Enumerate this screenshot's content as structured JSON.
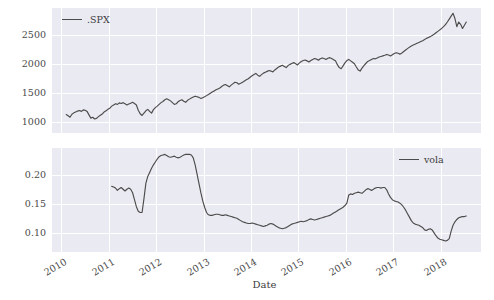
{
  "chart_data": [
    {
      "type": "line",
      "panel": "top",
      "title": "",
      "xlabel": "",
      "ylabel": "",
      "legend": ".SPX",
      "legend_position": "upper left",
      "grid": true,
      "xlim": [
        2009.8,
        2018.85
      ],
      "ylim": [
        820,
        2960
      ],
      "yticks": [
        1000,
        1500,
        2000,
        2500
      ],
      "ytick_labels": [
        "1000",
        "1500",
        "2000",
        "2500"
      ],
      "xticks": [
        2010,
        2011,
        2012,
        2013,
        2014,
        2015,
        2016,
        2017,
        2018
      ],
      "xtick_labels": [
        "2010",
        "2011",
        "2012",
        "2013",
        "2014",
        "2015",
        "2016",
        "2017",
        "2018"
      ],
      "series": [
        {
          "name": ".SPX",
          "color": "#4c4c4c",
          "x": [
            2010.1,
            2010.14,
            2010.18,
            2010.22,
            2010.26,
            2010.3,
            2010.34,
            2010.38,
            2010.42,
            2010.46,
            2010.5,
            2010.54,
            2010.58,
            2010.62,
            2010.66,
            2010.7,
            2010.74,
            2010.78,
            2010.82,
            2010.86,
            2010.9,
            2010.94,
            2010.98,
            2011.02,
            2011.06,
            2011.1,
            2011.14,
            2011.18,
            2011.22,
            2011.26,
            2011.3,
            2011.34,
            2011.38,
            2011.42,
            2011.46,
            2011.5,
            2011.54,
            2011.58,
            2011.62,
            2011.66,
            2011.7,
            2011.74,
            2011.78,
            2011.82,
            2011.86,
            2011.9,
            2011.94,
            2011.98,
            2012.02,
            2012.06,
            2012.1,
            2012.14,
            2012.18,
            2012.22,
            2012.26,
            2012.3,
            2012.34,
            2012.38,
            2012.42,
            2012.46,
            2012.5,
            2012.54,
            2012.58,
            2012.62,
            2012.66,
            2012.7,
            2012.74,
            2012.78,
            2012.82,
            2012.86,
            2012.9,
            2012.94,
            2012.98,
            2013.02,
            2013.06,
            2013.1,
            2013.14,
            2013.18,
            2013.22,
            2013.26,
            2013.3,
            2013.34,
            2013.38,
            2013.42,
            2013.46,
            2013.5,
            2013.54,
            2013.58,
            2013.62,
            2013.66,
            2013.7,
            2013.74,
            2013.78,
            2013.82,
            2013.86,
            2013.9,
            2013.94,
            2013.98,
            2014.02,
            2014.06,
            2014.1,
            2014.14,
            2014.18,
            2014.22,
            2014.26,
            2014.3,
            2014.34,
            2014.38,
            2014.42,
            2014.46,
            2014.5,
            2014.54,
            2014.58,
            2014.62,
            2014.66,
            2014.7,
            2014.74,
            2014.78,
            2014.82,
            2014.86,
            2014.9,
            2014.94,
            2014.98,
            2015.02,
            2015.06,
            2015.1,
            2015.14,
            2015.18,
            2015.22,
            2015.26,
            2015.3,
            2015.34,
            2015.38,
            2015.42,
            2015.46,
            2015.5,
            2015.54,
            2015.58,
            2015.62,
            2015.66,
            2015.7,
            2015.74,
            2015.78,
            2015.82,
            2015.86,
            2015.9,
            2015.94,
            2015.98,
            2016.02,
            2016.06,
            2016.1,
            2016.14,
            2016.18,
            2016.22,
            2016.26,
            2016.3,
            2016.34,
            2016.38,
            2016.42,
            2016.46,
            2016.5,
            2016.54,
            2016.58,
            2016.62,
            2016.66,
            2016.7,
            2016.74,
            2016.78,
            2016.82,
            2016.86,
            2016.9,
            2016.94,
            2016.98,
            2017.02,
            2017.06,
            2017.1,
            2017.14,
            2017.18,
            2017.22,
            2017.26,
            2017.3,
            2017.34,
            2017.38,
            2017.42,
            2017.46,
            2017.5,
            2017.54,
            2017.58,
            2017.62,
            2017.66,
            2017.7,
            2017.74,
            2017.78,
            2017.82,
            2017.86,
            2017.9,
            2017.94,
            2017.98,
            2018.02,
            2018.06,
            2018.1,
            2018.14,
            2018.18,
            2018.22,
            2018.26,
            2018.3,
            2018.34,
            2018.38,
            2018.42,
            2018.46,
            2018.5,
            2018.54
          ],
          "y": [
            1136,
            1115,
            1090,
            1140,
            1165,
            1180,
            1195,
            1205,
            1190,
            1215,
            1210,
            1190,
            1130,
            1075,
            1090,
            1060,
            1070,
            1100,
            1125,
            1145,
            1180,
            1200,
            1225,
            1245,
            1280,
            1300,
            1320,
            1310,
            1335,
            1325,
            1340,
            1320,
            1300,
            1315,
            1330,
            1345,
            1325,
            1300,
            1210,
            1150,
            1120,
            1160,
            1200,
            1225,
            1190,
            1160,
            1220,
            1255,
            1280,
            1310,
            1340,
            1360,
            1390,
            1405,
            1390,
            1370,
            1340,
            1310,
            1320,
            1355,
            1375,
            1390,
            1365,
            1345,
            1380,
            1400,
            1420,
            1435,
            1450,
            1440,
            1430,
            1410,
            1425,
            1440,
            1460,
            1480,
            1500,
            1520,
            1540,
            1560,
            1575,
            1590,
            1615,
            1640,
            1650,
            1630,
            1610,
            1640,
            1665,
            1690,
            1680,
            1655,
            1670,
            1690,
            1710,
            1730,
            1750,
            1775,
            1800,
            1820,
            1840,
            1810,
            1790,
            1820,
            1845,
            1860,
            1875,
            1890,
            1880,
            1865,
            1900,
            1925,
            1950,
            1965,
            1980,
            1960,
            1940,
            1975,
            1995,
            2010,
            2025,
            2005,
            1985,
            2020,
            2045,
            2060,
            2070,
            2055,
            2035,
            2060,
            2080,
            2095,
            2085,
            2065,
            2090,
            2105,
            2095,
            2080,
            2100,
            2110,
            2095,
            2075,
            2055,
            1990,
            1940,
            1920,
            1970,
            2020,
            2060,
            2080,
            2055,
            2030,
            2005,
            1950,
            1900,
            1880,
            1930,
            1975,
            2010,
            2045,
            2060,
            2080,
            2095,
            2090,
            2105,
            2120,
            2130,
            2140,
            2150,
            2165,
            2155,
            2140,
            2160,
            2180,
            2195,
            2185,
            2170,
            2190,
            2215,
            2240,
            2265,
            2290,
            2310,
            2325,
            2340,
            2355,
            2370,
            2385,
            2400,
            2420,
            2440,
            2455,
            2470,
            2490,
            2510,
            2535,
            2560,
            2585,
            2610,
            2640,
            2675,
            2720,
            2770,
            2820,
            2870,
            2780,
            2640,
            2720,
            2680,
            2610,
            2665,
            2720
          ]
        }
      ]
    },
    {
      "type": "line",
      "panel": "bottom",
      "title": "",
      "xlabel": "Date",
      "ylabel": "",
      "legend": "vola",
      "legend_position": "upper right",
      "grid": true,
      "xlim": [
        2009.8,
        2018.85
      ],
      "ylim": [
        0.068,
        0.247
      ],
      "yticks": [
        0.1,
        0.15,
        0.2
      ],
      "ytick_labels": [
        "0.10",
        "0.15",
        "0.20"
      ],
      "xticks": [
        2010,
        2011,
        2012,
        2013,
        2014,
        2015,
        2016,
        2017,
        2018
      ],
      "xtick_labels": [
        "2010",
        "2011",
        "2012",
        "2013",
        "2014",
        "2015",
        "2016",
        "2017",
        "2018"
      ],
      "series": [
        {
          "name": "vola",
          "color": "#6b6b6b",
          "x": [
            2011.06,
            2011.1,
            2011.14,
            2011.18,
            2011.22,
            2011.26,
            2011.3,
            2011.34,
            2011.38,
            2011.42,
            2011.46,
            2011.5,
            2011.54,
            2011.58,
            2011.62,
            2011.66,
            2011.7,
            2011.74,
            2011.78,
            2011.82,
            2011.86,
            2011.9,
            2011.94,
            2011.98,
            2012.02,
            2012.06,
            2012.1,
            2012.14,
            2012.18,
            2012.22,
            2012.26,
            2012.3,
            2012.34,
            2012.38,
            2012.42,
            2012.46,
            2012.5,
            2012.54,
            2012.58,
            2012.62,
            2012.66,
            2012.7,
            2012.74,
            2012.78,
            2012.82,
            2012.86,
            2012.9,
            2012.94,
            2012.98,
            2013.02,
            2013.06,
            2013.1,
            2013.14,
            2013.18,
            2013.22,
            2013.26,
            2013.3,
            2013.34,
            2013.38,
            2013.42,
            2013.46,
            2013.5,
            2013.54,
            2013.58,
            2013.62,
            2013.66,
            2013.7,
            2013.74,
            2013.78,
            2013.82,
            2013.86,
            2013.9,
            2013.94,
            2013.98,
            2014.02,
            2014.06,
            2014.1,
            2014.14,
            2014.18,
            2014.22,
            2014.26,
            2014.3,
            2014.34,
            2014.38,
            2014.42,
            2014.46,
            2014.5,
            2014.54,
            2014.58,
            2014.62,
            2014.66,
            2014.7,
            2014.74,
            2014.78,
            2014.82,
            2014.86,
            2014.9,
            2014.94,
            2014.98,
            2015.02,
            2015.06,
            2015.1,
            2015.14,
            2015.18,
            2015.22,
            2015.26,
            2015.3,
            2015.34,
            2015.38,
            2015.42,
            2015.46,
            2015.5,
            2015.54,
            2015.58,
            2015.62,
            2015.66,
            2015.7,
            2015.74,
            2015.78,
            2015.82,
            2015.86,
            2015.9,
            2015.94,
            2015.98,
            2016.02,
            2016.06,
            2016.1,
            2016.14,
            2016.18,
            2016.22,
            2016.26,
            2016.3,
            2016.34,
            2016.38,
            2016.42,
            2016.46,
            2016.5,
            2016.54,
            2016.58,
            2016.62,
            2016.66,
            2016.7,
            2016.74,
            2016.78,
            2016.82,
            2016.86,
            2016.9,
            2016.94,
            2016.98,
            2017.02,
            2017.06,
            2017.1,
            2017.14,
            2017.18,
            2017.22,
            2017.26,
            2017.3,
            2017.34,
            2017.38,
            2017.42,
            2017.46,
            2017.5,
            2017.54,
            2017.58,
            2017.62,
            2017.66,
            2017.7,
            2017.74,
            2017.78,
            2017.82,
            2017.86,
            2017.9,
            2017.94,
            2017.98,
            2018.02,
            2018.06,
            2018.1,
            2018.14,
            2018.18,
            2018.22,
            2018.26,
            2018.3,
            2018.34,
            2018.38,
            2018.42,
            2018.46,
            2018.5,
            2018.54
          ],
          "y": [
            0.181,
            0.18,
            0.178,
            0.174,
            0.177,
            0.179,
            0.176,
            0.173,
            0.176,
            0.178,
            0.176,
            0.17,
            0.158,
            0.146,
            0.138,
            0.136,
            0.136,
            0.16,
            0.186,
            0.198,
            0.205,
            0.212,
            0.218,
            0.223,
            0.228,
            0.232,
            0.234,
            0.235,
            0.236,
            0.234,
            0.232,
            0.231,
            0.232,
            0.233,
            0.231,
            0.23,
            0.231,
            0.233,
            0.235,
            0.236,
            0.236,
            0.236,
            0.235,
            0.23,
            0.218,
            0.202,
            0.186,
            0.17,
            0.156,
            0.145,
            0.136,
            0.132,
            0.131,
            0.131,
            0.132,
            0.133,
            0.133,
            0.132,
            0.131,
            0.131,
            0.132,
            0.131,
            0.13,
            0.129,
            0.128,
            0.127,
            0.126,
            0.124,
            0.122,
            0.12,
            0.119,
            0.118,
            0.117,
            0.117,
            0.118,
            0.117,
            0.116,
            0.115,
            0.114,
            0.113,
            0.112,
            0.113,
            0.114,
            0.116,
            0.117,
            0.116,
            0.114,
            0.112,
            0.11,
            0.109,
            0.108,
            0.109,
            0.11,
            0.112,
            0.114,
            0.116,
            0.117,
            0.118,
            0.119,
            0.12,
            0.121,
            0.12,
            0.121,
            0.122,
            0.124,
            0.125,
            0.124,
            0.123,
            0.124,
            0.125,
            0.126,
            0.127,
            0.128,
            0.129,
            0.13,
            0.131,
            0.133,
            0.135,
            0.137,
            0.139,
            0.141,
            0.143,
            0.145,
            0.148,
            0.152,
            0.166,
            0.168,
            0.167,
            0.169,
            0.17,
            0.171,
            0.17,
            0.169,
            0.172,
            0.175,
            0.177,
            0.176,
            0.174,
            0.176,
            0.178,
            0.179,
            0.179,
            0.178,
            0.179,
            0.179,
            0.175,
            0.168,
            0.162,
            0.158,
            0.156,
            0.155,
            0.154,
            0.152,
            0.149,
            0.145,
            0.14,
            0.134,
            0.128,
            0.122,
            0.118,
            0.116,
            0.115,
            0.114,
            0.112,
            0.11,
            0.106,
            0.105,
            0.107,
            0.108,
            0.106,
            0.101,
            0.096,
            0.092,
            0.09,
            0.089,
            0.088,
            0.087,
            0.088,
            0.091,
            0.104,
            0.114,
            0.12,
            0.124,
            0.127,
            0.128,
            0.129,
            0.129,
            0.13
          ]
        }
      ]
    }
  ],
  "axes": {
    "xlabel": "Date",
    "xtick_labels": [
      "2010",
      "2011",
      "2012",
      "2013",
      "2014",
      "2015",
      "2016",
      "2017",
      "2018"
    ],
    "spx_ytick_labels": [
      "2500",
      "2000",
      "1500",
      "1000"
    ],
    "vola_ytick_labels": [
      "0.20",
      "0.15",
      "0.10"
    ]
  },
  "legends": {
    "spx": ".SPX",
    "vola": "vola"
  },
  "colors": {
    "line": "#4c4c4c",
    "panel_background": "#eaeaf2",
    "gridline": "#ffffff",
    "text": "#4a4a4a"
  }
}
